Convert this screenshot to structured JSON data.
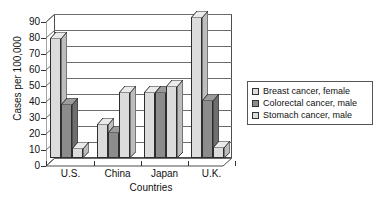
{
  "chart_data": {
    "type": "bar",
    "title": "",
    "subtitle": "",
    "xlabel": "Countries",
    "ylabel": "Cases per 100,000",
    "categories": [
      "U.S.",
      "China",
      "Japan",
      "U.K."
    ],
    "series": [
      {
        "name": "Breast cancer, female",
        "values": [
          75,
          21,
          41,
          88
        ],
        "swatch": "#dcdcdc"
      },
      {
        "name": "Colorectal cancer, male",
        "values": [
          34,
          16,
          41,
          36
        ],
        "swatch": "#8c8c8c"
      },
      {
        "name": "Stomach cancer, male",
        "values": [
          6,
          41,
          45,
          7
        ],
        "swatch": "#dcdcdc"
      }
    ],
    "ylim": [
      0,
      90
    ],
    "yticks": [
      0,
      10,
      20,
      30,
      40,
      50,
      60,
      70,
      80,
      90
    ],
    "ytick_labels": [
      "0",
      "10",
      "20",
      "30",
      "40",
      "50",
      "60",
      "70",
      "80",
      "90"
    ],
    "grid": true,
    "legend_position": "right",
    "style": "3d-column"
  },
  "axes": {
    "y_title": "Cases per 100,000",
    "x_title": "Countries"
  },
  "legend": {
    "entries": [
      {
        "label": "Breast cancer, female"
      },
      {
        "label": "Colorectal cancer, male"
      },
      {
        "label": "Stomach cancer, male"
      }
    ]
  }
}
